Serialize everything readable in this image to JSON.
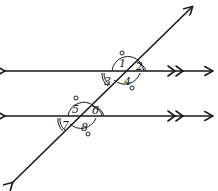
{
  "diagram": {
    "type": "parallel-lines-cut-by-transversal",
    "lines": [
      {
        "name": "top-parallel-line",
        "y": 71,
        "marker": "double-arrow"
      },
      {
        "name": "bottom-parallel-line",
        "y": 116,
        "marker": "double-arrow"
      }
    ],
    "transversal": {
      "from": [
        10,
        185
      ],
      "to": [
        194,
        5
      ]
    },
    "angles": [
      {
        "id": "1",
        "label": "1",
        "x": 121,
        "y": 65
      },
      {
        "id": "2",
        "label": "2",
        "x": 138,
        "y": 70
      },
      {
        "id": "3",
        "label": "3",
        "x": 104,
        "y": 85
      },
      {
        "id": "4",
        "label": "4",
        "x": 124,
        "y": 84
      },
      {
        "id": "5",
        "label": "5",
        "x": 73,
        "y": 112
      },
      {
        "id": "6",
        "label": "6",
        "x": 93,
        "y": 113
      },
      {
        "id": "7",
        "label": "7",
        "x": 62,
        "y": 128
      },
      {
        "id": "8",
        "label": "8",
        "x": 82,
        "y": 130
      }
    ],
    "colors": {
      "ink": "#1a1a1a",
      "background": "#ffffff"
    }
  }
}
